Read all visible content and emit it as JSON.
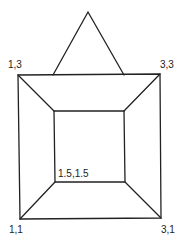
{
  "diagram": {
    "labels": {
      "outer_top_left": "1,3",
      "outer_top_right": "3,3",
      "outer_bottom_left": "1,1",
      "outer_bottom_right": "3,1",
      "inner_bottom_left": "1.5,1.5"
    },
    "colors": {
      "line": "#222222",
      "background": "#ffffff"
    }
  }
}
